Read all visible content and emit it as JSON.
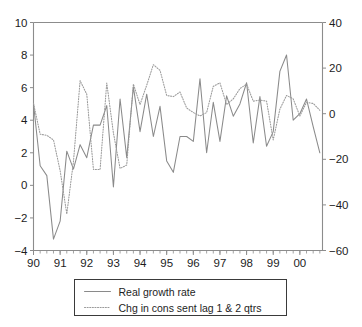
{
  "chart_data": {
    "type": "line",
    "title": "",
    "subtitle": "",
    "xlabel": "",
    "ylabel": "",
    "grid": false,
    "legend_position": "below",
    "x": [
      1990.0,
      1990.25,
      1990.5,
      1990.75,
      1991.0,
      1991.25,
      1991.5,
      1991.75,
      1992.0,
      1992.25,
      1992.5,
      1992.75,
      1993.0,
      1993.25,
      1993.5,
      1993.75,
      1994.0,
      1994.25,
      1994.5,
      1994.75,
      1995.0,
      1995.25,
      1995.5,
      1995.75,
      1996.0,
      1996.25,
      1996.5,
      1996.75,
      1997.0,
      1997.25,
      1997.5,
      1997.75,
      1998.0,
      1998.25,
      1998.5,
      1998.75,
      1999.0,
      1999.25,
      1999.5,
      1999.75,
      2000.0,
      2000.25,
      2000.5,
      2000.75
    ],
    "xtick_labels": [
      "90",
      "91",
      "92",
      "93",
      "94",
      "95",
      "96",
      "97",
      "98",
      "99",
      "00"
    ],
    "xtick_values": [
      1990,
      1991,
      1992,
      1993,
      1994,
      1995,
      1996,
      1997,
      1998,
      1999,
      2000
    ],
    "xlim": [
      1990.0,
      2000.85
    ],
    "minor_ticks_per_year": 4,
    "left_axis": {
      "label": "",
      "ylim": [
        -4,
        10
      ],
      "ticks": [
        -4,
        -2,
        0,
        2,
        4,
        6,
        8,
        10
      ],
      "tick_labels": [
        "−4",
        "−2",
        "0",
        "2",
        "4",
        "6",
        "8",
        "10"
      ]
    },
    "right_axis": {
      "label": "",
      "ylim": [
        -60,
        40
      ],
      "ticks": [
        -60,
        -40,
        -20,
        0,
        20,
        40
      ],
      "tick_labels": [
        "−60",
        "−40",
        "−20",
        "0",
        "20",
        "40"
      ]
    },
    "series": [
      {
        "name": "Real growth rate",
        "style": "solid",
        "color": "#8a8a8a",
        "axis": "left",
        "values": [
          5.0,
          1.2,
          0.6,
          -3.3,
          -2.2,
          2.1,
          1.0,
          2.5,
          1.7,
          3.7,
          3.7,
          4.9,
          -0.1,
          5.3,
          1.7,
          6.05,
          3.3,
          5.6,
          3.0,
          4.85,
          1.5,
          0.8,
          3.0,
          3.0,
          2.7,
          6.55,
          2.0,
          5.1,
          2.7,
          5.5,
          4.25,
          5.0,
          6.3,
          2.6,
          5.45,
          2.4,
          3.3,
          7.0,
          8.0,
          4.0,
          4.4,
          5.3,
          3.6,
          2.0
        ]
      },
      {
        "name": "Chg in cons sent lag 1 & 2 qtrs",
        "style": "dotted",
        "color": "#9a9a9a",
        "axis": "right",
        "values": [
          4.5,
          -9.0,
          -9.5,
          -11.5,
          -25.0,
          -44.0,
          -21.0,
          14.5,
          8.5,
          -24.5,
          -24.5,
          13.5,
          -8.5,
          -24.0,
          -22.5,
          13.0,
          4.0,
          12.5,
          21.5,
          19.0,
          8.0,
          7.5,
          9.5,
          2.5,
          0.5,
          -1.0,
          0.5,
          12.0,
          13.5,
          4.0,
          6.5,
          11.0,
          13.0,
          5.5,
          6.0,
          5.5,
          -11.5,
          2.0,
          8.0,
          6.5,
          -1.0,
          5.0,
          4.5,
          1.5
        ]
      }
    ],
    "legend": [
      {
        "label": "Real growth rate",
        "style": "solid"
      },
      {
        "label": "Chg in cons sent lag 1 & 2 qtrs",
        "style": "dotted"
      }
    ]
  }
}
